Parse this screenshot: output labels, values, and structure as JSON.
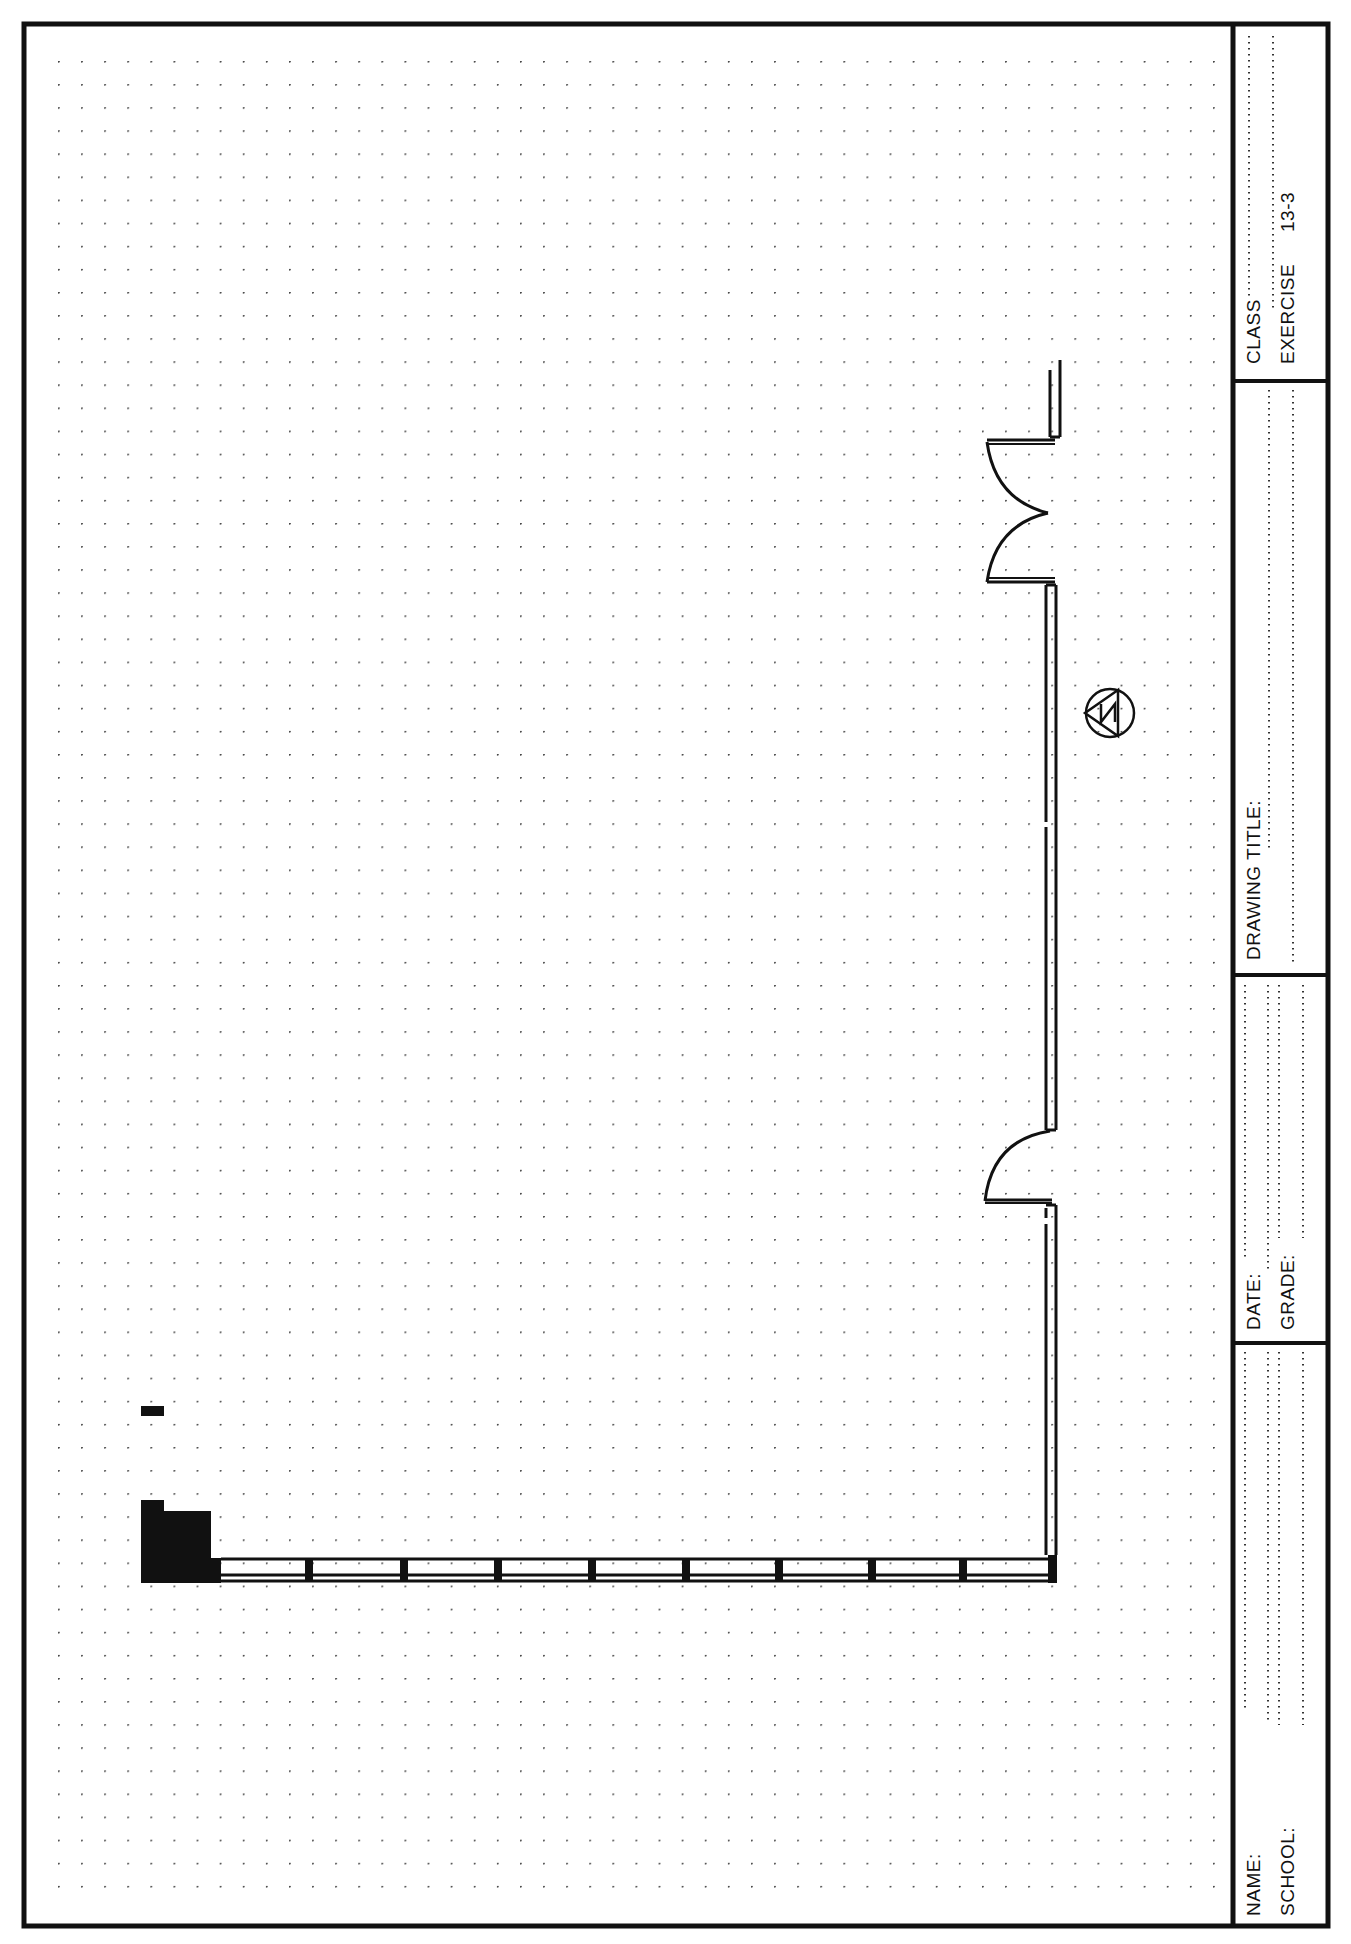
{
  "sheet": {
    "title_block": {
      "class_label": "CLASS",
      "exercise_label": "EXERCISE",
      "exercise_number": "13-3",
      "drawing_title_label": "DRAWING TITLE:",
      "date_label": "DATE:",
      "grade_label": "GRADE:",
      "name_label": "NAME:",
      "school_label": "SCHOOL:"
    },
    "drawing": {
      "north_arrow_letter": "N",
      "grid": {
        "spacing_px": 23,
        "start_x": 58,
        "start_y": 61
      },
      "windows_count": 9,
      "doors": [
        {
          "type": "double-swing",
          "location": "east wall, upper"
        },
        {
          "type": "single-swing",
          "location": "east wall, lower"
        }
      ]
    },
    "colors": {
      "ink": "#111111",
      "paper": "#ffffff",
      "grid_dot": "#444444"
    }
  }
}
